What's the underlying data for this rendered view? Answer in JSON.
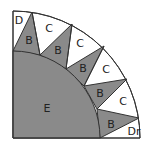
{
  "diagram": {
    "colors": {
      "shaded": "#8a8a8a",
      "light": "#ffffff",
      "outline": "#333333"
    },
    "labels": {
      "E": "E",
      "D": "D",
      "Dr": "Dr",
      "B": [
        "B",
        "B",
        "B",
        "B",
        "B"
      ],
      "C": [
        "C",
        "C",
        "C",
        "C"
      ]
    }
  }
}
